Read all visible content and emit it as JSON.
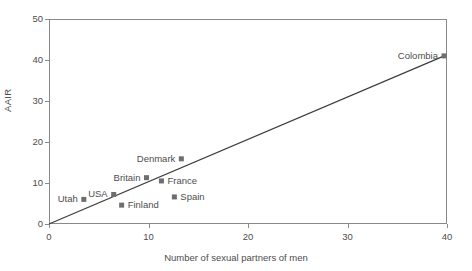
{
  "chart_data": {
    "type": "scatter",
    "title": "",
    "xlabel": "Number of sexual partners of men",
    "ylabel": "AAIR",
    "xlim": [
      0,
      40
    ],
    "ylim": [
      0,
      50
    ],
    "xticks": [
      0,
      10,
      20,
      30,
      40
    ],
    "yticks": [
      0,
      10,
      20,
      30,
      40,
      50
    ],
    "grid": false,
    "legend": "none",
    "marker_color": "#6e6e6e",
    "line_color": "#3d3d3d",
    "axis_color": "#8a8a8a",
    "text_color": "#4d4d4d",
    "points": [
      {
        "label": "Utah",
        "x": 3.5,
        "y": 6.0,
        "label_side": "left"
      },
      {
        "label": "USA",
        "x": 6.5,
        "y": 7.2,
        "label_side": "left"
      },
      {
        "label": "Finland",
        "x": 7.3,
        "y": 4.6,
        "label_side": "right"
      },
      {
        "label": "Britain",
        "x": 9.8,
        "y": 11.3,
        "label_side": "left"
      },
      {
        "label": "France",
        "x": 11.3,
        "y": 10.5,
        "label_side": "right"
      },
      {
        "label": "Spain",
        "x": 12.6,
        "y": 6.6,
        "label_side": "right"
      },
      {
        "label": "Denmark",
        "x": 13.3,
        "y": 15.9,
        "label_side": "left"
      },
      {
        "label": "Colombia",
        "x": 39.7,
        "y": 41.0,
        "label_side": "left"
      }
    ],
    "trendline": {
      "description": "fitted straight line",
      "x_start": 0.0,
      "y_start": 0.0,
      "x_end": 39.9,
      "y_end": 41.2
    }
  }
}
